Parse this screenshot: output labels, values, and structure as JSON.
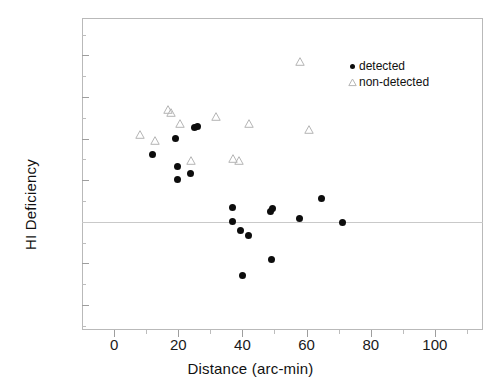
{
  "chart_data": {
    "type": "scatter",
    "title": "",
    "xlabel": "Distance (arc-min)",
    "ylabel": "HI Deficiency",
    "xlim": [
      -10,
      115
    ],
    "ylim": [
      -1.3,
      2.45
    ],
    "xticks": [
      0,
      20,
      40,
      60,
      80,
      100
    ],
    "xticklabels": [
      "0",
      "20",
      "40",
      "60",
      "80",
      "100"
    ],
    "xminorticks": [
      10,
      30,
      50,
      70,
      90,
      110
    ],
    "yticks": [
      -1.0,
      -0.5,
      0.0,
      0.5,
      1.0,
      1.5,
      2.0
    ],
    "yticklabels": [
      "-1.0",
      "-0.5",
      "0.0",
      "0.5",
      "1.0",
      "1.5",
      "2.0"
    ],
    "yminorticks": [
      -1.25,
      -0.75,
      -0.25,
      0.25,
      0.75,
      1.25,
      1.75,
      2.25
    ],
    "grid": false,
    "reference_line": {
      "axis": "y",
      "value": 0.0,
      "color": "#c9c9c9"
    },
    "legend_position": "upper right",
    "series": [
      {
        "name": "detected",
        "marker": "filled-circle",
        "color": "#0d0d0d",
        "points": [
          {
            "x": 12.0,
            "y": 0.81
          },
          {
            "x": 19.3,
            "y": 1.0
          },
          {
            "x": 19.9,
            "y": 0.67
          },
          {
            "x": 19.9,
            "y": 0.51
          },
          {
            "x": 23.9,
            "y": 0.58
          },
          {
            "x": 25.2,
            "y": 1.13
          },
          {
            "x": 25.9,
            "y": 1.15
          },
          {
            "x": 37.0,
            "y": 0.17
          },
          {
            "x": 37.0,
            "y": 0.01
          },
          {
            "x": 39.3,
            "y": -0.11
          },
          {
            "x": 40.0,
            "y": -0.65
          },
          {
            "x": 42.0,
            "y": -0.17
          },
          {
            "x": 48.7,
            "y": 0.12
          },
          {
            "x": 49.5,
            "y": 0.16
          },
          {
            "x": 49.0,
            "y": -0.45
          },
          {
            "x": 57.7,
            "y": 0.04
          },
          {
            "x": 64.8,
            "y": 0.28
          },
          {
            "x": 71.3,
            "y": -0.01
          }
        ]
      },
      {
        "name": "non-detected",
        "marker": "open-triangle",
        "color": "#b5b5b5",
        "points": [
          {
            "x": 8.0,
            "y": 1.01
          },
          {
            "x": 12.8,
            "y": 0.94
          },
          {
            "x": 16.9,
            "y": 1.31
          },
          {
            "x": 17.6,
            "y": 1.27
          },
          {
            "x": 20.7,
            "y": 1.14
          },
          {
            "x": 24.0,
            "y": 0.69
          },
          {
            "x": 31.8,
            "y": 1.22
          },
          {
            "x": 37.0,
            "y": 0.72
          },
          {
            "x": 39.0,
            "y": 0.69
          },
          {
            "x": 42.2,
            "y": 1.14
          },
          {
            "x": 58.0,
            "y": 1.89
          },
          {
            "x": 60.8,
            "y": 1.07
          }
        ]
      }
    ]
  },
  "legend": {
    "entries": [
      {
        "label": "detected",
        "marker": "filled-circle"
      },
      {
        "label": "non-detected",
        "marker": "open-triangle"
      }
    ]
  }
}
